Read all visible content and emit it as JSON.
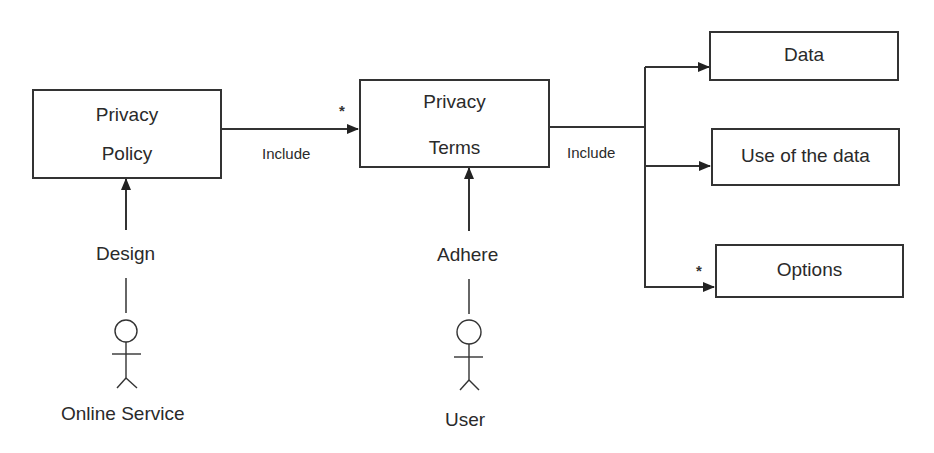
{
  "diagram": {
    "nodes": {
      "privacy_policy": {
        "line1": "Privacy",
        "line2": "Policy"
      },
      "privacy_terms": {
        "line1": "Privacy",
        "line2": "Terms"
      },
      "data": {
        "label": "Data"
      },
      "use_of_data": {
        "label": "Use of the data"
      },
      "options": {
        "label": "Options"
      }
    },
    "actors": {
      "online_service": {
        "label": "Online Service"
      },
      "user": {
        "label": "User"
      }
    },
    "edges": {
      "policy_to_terms": {
        "label": "Include",
        "multiplicity": "*"
      },
      "terms_to_items": {
        "label": "Include"
      },
      "to_options": {
        "multiplicity": "*"
      },
      "design": {
        "label": "Design"
      },
      "adhere": {
        "label": "Adhere"
      }
    }
  }
}
